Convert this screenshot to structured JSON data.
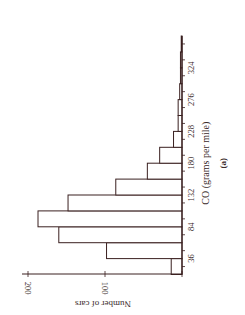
{
  "chart_data": {
    "type": "bar",
    "subtype": "histogram",
    "orientation": "rotated-90-clockwise",
    "title": "",
    "caption": "(a)",
    "xlabel": "CO (grams per mile)",
    "ylabel": "Number of cars",
    "bin_width": 24,
    "bin_edges": [
      12,
      36,
      60,
      84,
      108,
      132,
      156,
      180,
      204,
      228,
      252,
      276,
      300,
      324,
      348,
      372
    ],
    "categories": [
      "12-36",
      "36-60",
      "60-84",
      "84-108",
      "108-132",
      "132-156",
      "156-180",
      "180-204",
      "204-228",
      "228-252",
      "252-276",
      "276-300",
      "300-324",
      "324-348",
      "348-372"
    ],
    "values": [
      14,
      98,
      160,
      187,
      148,
      86,
      45,
      29,
      11,
      5,
      5,
      3,
      2,
      2,
      1
    ],
    "x_tick_labels": [
      "36",
      "84",
      "132",
      "180",
      "228",
      "276",
      "324"
    ],
    "y_tick_labels": [
      "100",
      "200"
    ],
    "ylim": [
      0,
      200
    ],
    "xlim": [
      12,
      372
    ],
    "grid": false,
    "legend": null,
    "colors": {
      "stroke": "#3a2020",
      "fill": "#ffffff"
    }
  }
}
